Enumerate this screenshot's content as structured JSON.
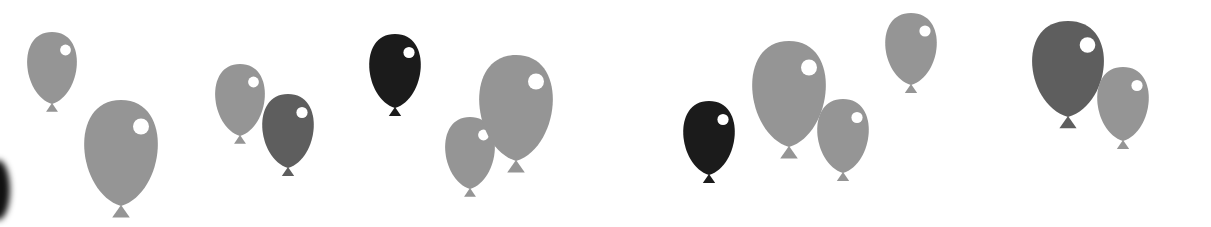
{
  "canvas": {
    "width": 1211,
    "height": 227,
    "background": "#ffffff"
  },
  "colors": {
    "light": "#959595",
    "medium": "#5e5e5e",
    "dark": "#1b1b1b",
    "highlight": "#ffffff"
  },
  "balloons": [
    {
      "cx": 52,
      "cy": 68,
      "rx": 27,
      "ry": 36,
      "tone": "light"
    },
    {
      "cx": 121,
      "cy": 153,
      "rx": 40,
      "ry": 53,
      "tone": "light"
    },
    {
      "cx": 240,
      "cy": 100,
      "rx": 27,
      "ry": 36,
      "tone": "light"
    },
    {
      "cx": 288,
      "cy": 131,
      "rx": 28,
      "ry": 37,
      "tone": "medium"
    },
    {
      "cx": 395,
      "cy": 71,
      "rx": 28,
      "ry": 37,
      "tone": "dark"
    },
    {
      "cx": 470,
      "cy": 153,
      "rx": 27,
      "ry": 36,
      "tone": "light"
    },
    {
      "cx": 516,
      "cy": 108,
      "rx": 40,
      "ry": 53,
      "tone": "light"
    },
    {
      "cx": 709,
      "cy": 138,
      "rx": 28,
      "ry": 37,
      "tone": "dark"
    },
    {
      "cx": 789,
      "cy": 94,
      "rx": 40,
      "ry": 53,
      "tone": "light"
    },
    {
      "cx": 843,
      "cy": 136,
      "rx": 28,
      "ry": 37,
      "tone": "light"
    },
    {
      "cx": 911,
      "cy": 49,
      "rx": 28,
      "ry": 36,
      "tone": "light"
    },
    {
      "cx": 1068,
      "cy": 69,
      "rx": 39,
      "ry": 48,
      "tone": "medium"
    },
    {
      "cx": 1123,
      "cy": 104,
      "rx": 28,
      "ry": 37,
      "tone": "light"
    }
  ]
}
